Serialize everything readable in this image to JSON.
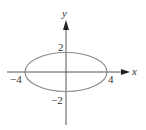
{
  "diagram": {
    "type": "ellipse-graph",
    "equation_implied": "x^2/16 + y^2/4 = 1",
    "axes": {
      "x_label": "x",
      "y_label": "y"
    },
    "ticks": {
      "x_neg": "−4",
      "x_pos": "4",
      "y_pos": "2",
      "y_neg": "−2"
    },
    "ellipse": {
      "center": [
        0,
        0
      ],
      "semi_major_x": 4,
      "semi_minor_y": 2
    },
    "colors": {
      "axis": "#555555",
      "ellipse": "#8a8a8a",
      "text": "#333333"
    }
  }
}
